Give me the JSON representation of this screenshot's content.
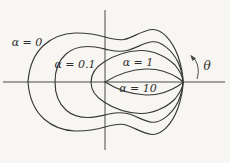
{
  "figure": {
    "background_color": "#f7f6f2",
    "line_color": "#383838",
    "axis_color": "#4a4a4a",
    "angle_label": "θ",
    "curves": [
      {
        "alpha": "0",
        "label": "α = 0",
        "shape": "large near-circular blob with slight dimple at top and bottom near vertical axis"
      },
      {
        "alpha": "0.1",
        "label": "α = 0.1",
        "shape": "medium rounded blob with slight dimple, inside alpha=0"
      },
      {
        "alpha": "1",
        "label": "α = 1",
        "shape": "forward lens-shaped lobe with rounded back just left of origin"
      },
      {
        "alpha": "10",
        "label": "α = 10",
        "shape": "narrowest forward lens-shaped lobe with cusp at origin"
      }
    ]
  }
}
